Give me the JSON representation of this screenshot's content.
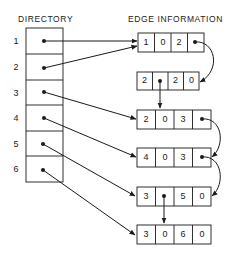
{
  "titles": {
    "directory": "DIRECTORY",
    "edge_information": "EDGE INFORMATION"
  },
  "directory": {
    "rows": [
      "1",
      "2",
      "3",
      "4",
      "5",
      "6"
    ]
  },
  "edge_records": [
    {
      "cells": [
        "1",
        "0",
        "2",
        "•"
      ]
    },
    {
      "cells": [
        "2",
        "•",
        "2",
        "0"
      ]
    },
    {
      "cells": [
        "2",
        "0",
        "3",
        "•"
      ]
    },
    {
      "cells": [
        "4",
        "0",
        "3",
        "•"
      ]
    },
    {
      "cells": [
        "3",
        "•",
        "5",
        "0"
      ]
    },
    {
      "cells": [
        "3",
        "0",
        "6",
        "0"
      ]
    }
  ],
  "pointers": [
    {
      "from": "directory-1",
      "to": "record-1"
    },
    {
      "from": "directory-2",
      "to": "record-1"
    },
    {
      "from": "directory-3",
      "to": "record-3"
    },
    {
      "from": "directory-4",
      "to": "record-4"
    },
    {
      "from": "directory-5",
      "to": "record-5"
    },
    {
      "from": "directory-6",
      "to": "record-6"
    },
    {
      "from": "record-1.cell-4",
      "to": "record-2"
    },
    {
      "from": "record-2.cell-2",
      "to": "record-3"
    },
    {
      "from": "record-3.cell-4",
      "to": "record-4"
    },
    {
      "from": "record-4.cell-4",
      "to": "record-5"
    },
    {
      "from": "record-5.cell-2",
      "to": "record-6"
    }
  ]
}
